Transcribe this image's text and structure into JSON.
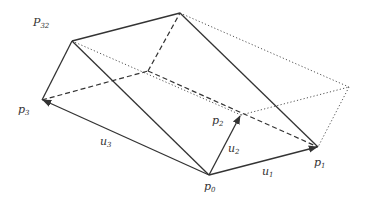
{
  "diagram": {
    "colors": {
      "line": "#333333",
      "background": "#ffffff"
    },
    "labels": {
      "p32": {
        "base": "P",
        "sub": "32"
      },
      "p3": {
        "base": "p",
        "sub": "3"
      },
      "p2": {
        "base": "p",
        "sub": "2"
      },
      "p1": {
        "base": "p",
        "sub": "1"
      },
      "p0": {
        "base": "p",
        "sub": "0"
      },
      "u1": {
        "base": "u",
        "sub": "1"
      },
      "u2": {
        "base": "u",
        "sub": "2"
      },
      "u3": {
        "base": "u",
        "sub": "3"
      }
    },
    "vertices": {
      "p0": [
        209,
        175
      ],
      "p1": [
        318,
        147
      ],
      "p2": [
        241,
        115
      ],
      "p3": [
        42,
        100
      ],
      "top_left": [
        72,
        41
      ],
      "top": [
        180,
        13
      ],
      "hidden": [
        148,
        71
      ],
      "far_right": [
        349,
        87
      ]
    }
  }
}
